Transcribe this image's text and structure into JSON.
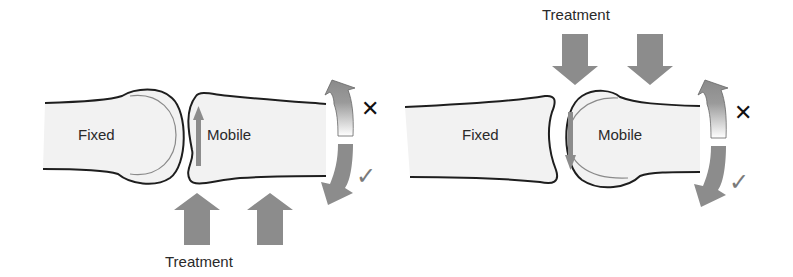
{
  "colors": {
    "bone_fill": "#f2f2f2",
    "outline": "#1e1e1e",
    "arrow": "#8c8c8c",
    "cross": "#111111",
    "check": "#7a7a7a"
  },
  "left_panel": {
    "fixed_label": "Fixed",
    "mobile_label": "Mobile",
    "treatment_label": "Treatment",
    "treatment_direction": "up",
    "glide_direction": "up",
    "wrong_mark": "✕",
    "right_mark": "✓"
  },
  "right_panel": {
    "fixed_label": "Fixed",
    "mobile_label": "Mobile",
    "treatment_label": "Treatment",
    "treatment_direction": "down",
    "glide_direction": "down",
    "wrong_mark": "✕",
    "right_mark": "✓"
  }
}
